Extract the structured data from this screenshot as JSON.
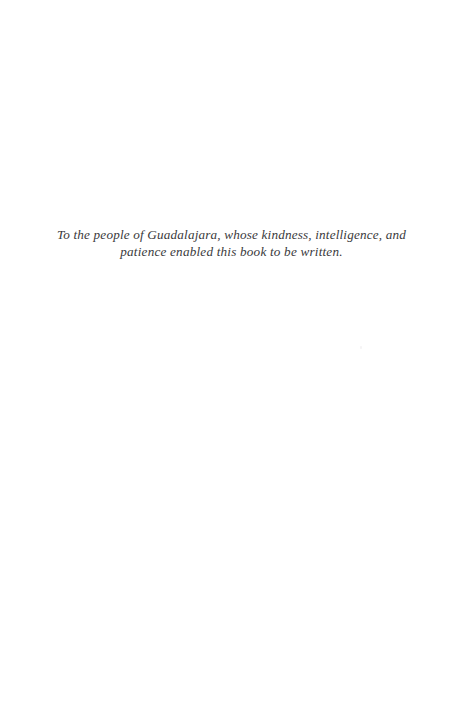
{
  "page": {
    "kind": "book-dedication-page",
    "width": 463,
    "height": 715,
    "background_color": "#ffffff",
    "ink_color": "#3a3a3c"
  },
  "dedication": {
    "lines": [
      "To the people of Guadalajara, whose kindness, intelligence, and",
      "patience enabled this book to be written."
    ],
    "full_text": "To the people of Guadalajara, whose kindness, intelligence, and patience enabled this book to be written.",
    "alignment": "center",
    "style": "italic"
  }
}
